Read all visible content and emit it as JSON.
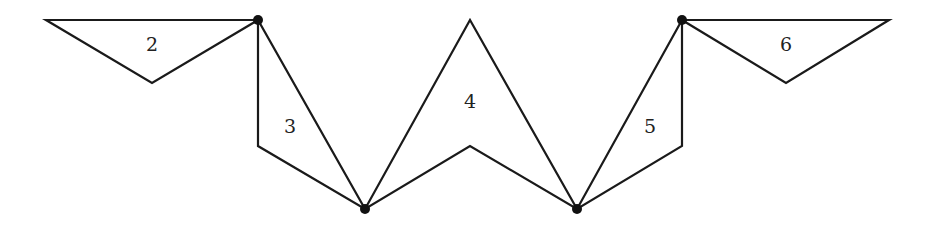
{
  "diagram": {
    "type": "polygon-fan",
    "stroke_color": "#1a1a1a",
    "vertex_color": "#111111",
    "shapes": [
      {
        "id": "2",
        "label": "2",
        "points": [
          [
            46,
            20
          ],
          [
            258,
            20
          ],
          [
            152,
            83
          ]
        ],
        "label_pos": [
          152,
          46
        ]
      },
      {
        "id": "3",
        "label": "3",
        "points": [
          [
            258,
            20
          ],
          [
            258,
            146
          ],
          [
            365,
            209
          ]
        ],
        "label_pos": [
          290,
          128
        ]
      },
      {
        "id": "4",
        "label": "4",
        "points": [
          [
            365,
            209
          ],
          [
            470,
            20
          ],
          [
            577,
            209
          ],
          [
            470,
            146
          ]
        ],
        "label_pos": [
          470,
          103
        ]
      },
      {
        "id": "5",
        "label": "5",
        "points": [
          [
            577,
            209
          ],
          [
            682,
            20
          ],
          [
            682,
            146
          ]
        ],
        "label_pos": [
          650,
          128
        ]
      },
      {
        "id": "6",
        "label": "6",
        "points": [
          [
            682,
            20
          ],
          [
            889,
            20
          ],
          [
            786,
            83
          ]
        ],
        "label_pos": [
          786,
          46
        ]
      }
    ],
    "vertices": [
      {
        "id": "v1",
        "pos": [
          258,
          20
        ]
      },
      {
        "id": "v2",
        "pos": [
          365,
          209
        ]
      },
      {
        "id": "v3",
        "pos": [
          577,
          209
        ]
      },
      {
        "id": "v4",
        "pos": [
          682,
          20
        ]
      }
    ]
  }
}
